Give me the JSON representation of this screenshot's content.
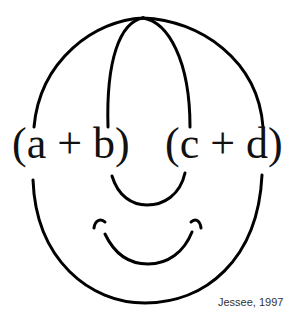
{
  "diagram": {
    "expressions": {
      "left": "(a + b)",
      "right": "(c + d)"
    },
    "credit": "Jessee, 1997"
  }
}
